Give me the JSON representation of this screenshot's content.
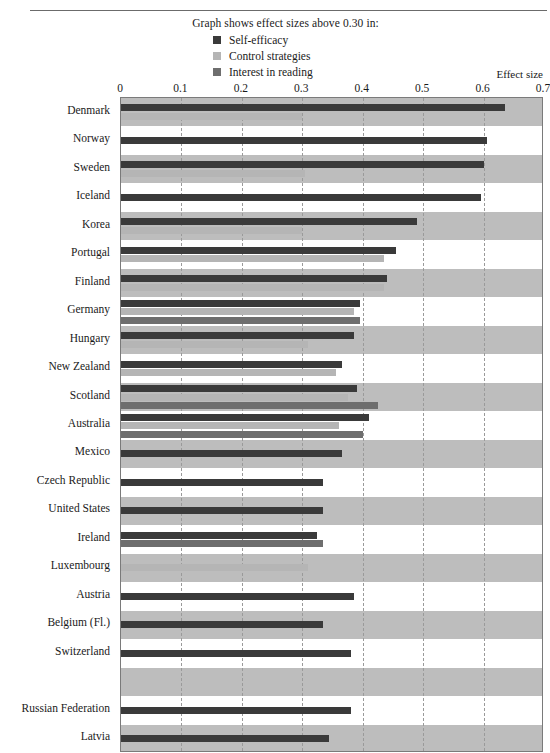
{
  "header": {
    "cut_title": "",
    "legend_caption": "Graph shows effect sizes above 0.30 in:",
    "effect_size_caption": "Effect size"
  },
  "legend": {
    "items": [
      {
        "label": "Self-efficacy",
        "color": "#3a3a3a",
        "icon": "square-swatch-icon"
      },
      {
        "label": "Control strategies",
        "color": "#b5b5b5",
        "icon": "square-swatch-icon"
      },
      {
        "label": "Interest in reading",
        "color": "#6e6e6e",
        "icon": "square-swatch-icon"
      }
    ]
  },
  "colors": {
    "self_efficacy": "#3a3a3a",
    "control_strategies": "#b5b5b5",
    "interest_in_reading": "#6e6e6e",
    "band_shaded": "#bdbdbd",
    "band_plain": "#ffffff",
    "gridline": "#9a9a9a",
    "axis": "#7a7a7a"
  },
  "chart_data": {
    "type": "bar",
    "orientation": "horizontal",
    "title": "Graph shows effect sizes above 0.30 in:",
    "xlabel": "Effect size",
    "ylabel": "",
    "xlim": [
      0,
      0.7
    ],
    "xticks": [
      0,
      0.1,
      0.2,
      0.3,
      0.4,
      0.5,
      0.6,
      0.7
    ],
    "xtick_labels": [
      "0",
      "0.1",
      "0.2",
      "0.3",
      "0.4",
      "0.5",
      "0.6",
      "0.7"
    ],
    "grid": "vertical-dashed",
    "legend_position": "top-center",
    "threshold": 0.3,
    "categories": [
      "Denmark",
      "Norway",
      "Sweden",
      "Iceland",
      "Korea",
      "Portugal",
      "Finland",
      "Germany",
      "Hungary",
      "New Zealand",
      "Scotland",
      "Australia",
      "Mexico",
      "Czech Republic",
      "United States",
      "Ireland",
      "Luxembourg",
      "Austria",
      "Belgium (Fl.)",
      "Switzerland",
      "",
      "Russian Federation",
      "Latvia"
    ],
    "series": [
      {
        "name": "Self-efficacy",
        "color": "#3a3a3a",
        "values": [
          0.635,
          0.605,
          0.6,
          0.595,
          0.49,
          0.455,
          0.44,
          0.395,
          0.385,
          0.365,
          0.39,
          0.41,
          0.365,
          0.335,
          0.335,
          0.325,
          null,
          0.385,
          0.335,
          0.38,
          null,
          0.38,
          0.345
        ]
      },
      {
        "name": "Control strategies",
        "color": "#b5b5b5",
        "values": [
          0.3,
          null,
          0.305,
          null,
          0.3,
          0.435,
          0.435,
          0.385,
          0.31,
          0.355,
          0.375,
          0.36,
          null,
          null,
          null,
          null,
          0.31,
          null,
          null,
          null,
          null,
          null,
          null
        ]
      },
      {
        "name": "Interest in reading",
        "color": "#6e6e6e",
        "values": [
          null,
          null,
          null,
          null,
          null,
          null,
          null,
          0.395,
          null,
          null,
          0.425,
          0.4,
          null,
          null,
          null,
          0.335,
          null,
          null,
          null,
          null,
          null,
          null,
          null
        ]
      }
    ]
  }
}
